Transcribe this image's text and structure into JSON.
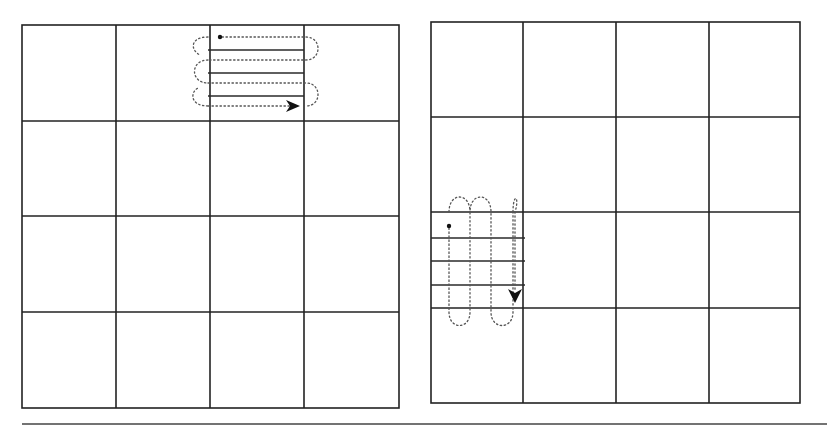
{
  "figure": {
    "colors": {
      "background": "#ffffff",
      "grid": "#222222",
      "hatch": "#2a2a2a",
      "path": "#555555",
      "rule": "#444444"
    },
    "panels": [
      {
        "id": "left",
        "label": "horizontal-raster-scan",
        "rows": 4,
        "cols": 4,
        "bounds": {
          "x0": 22,
          "y0": 25,
          "x1": 399,
          "y1": 408
        },
        "col_lines": [
          116,
          210,
          304
        ],
        "row_lines": [
          121,
          216,
          312
        ],
        "highlighted_cell": {
          "row": 0,
          "col": 2
        },
        "scan_direction": "horizontal",
        "hatch_lines_y": [
          50,
          73,
          96
        ],
        "hatch_x": [
          207,
          303
        ],
        "pass_y": [
          37,
          60,
          83,
          106
        ],
        "start_point": {
          "x": 220,
          "y": 37
        },
        "end_arrow": {
          "x": 298,
          "y": 105,
          "direction": "right"
        }
      },
      {
        "id": "right",
        "label": "vertical-raster-scan",
        "rows": 4,
        "cols": 4,
        "bounds": {
          "x0": 431,
          "y0": 22,
          "x1": 800,
          "y1": 403
        },
        "col_lines": [
          523,
          616,
          709
        ],
        "row_lines": [
          117,
          212,
          308
        ],
        "highlighted_cell": {
          "row": 2,
          "col": 0
        },
        "scan_direction": "vertical",
        "hatch_lines_y": [
          238,
          261,
          285
        ],
        "hatch_x": [
          431,
          525
        ],
        "pass_x": [
          449,
          470,
          491,
          513
        ],
        "start_point": {
          "x": 449,
          "y": 226
        },
        "end_arrow": {
          "x": 514,
          "y": 301,
          "direction": "down"
        }
      }
    ],
    "bottom_rule": {
      "x0": 22,
      "x1": 827,
      "y": 424
    }
  }
}
